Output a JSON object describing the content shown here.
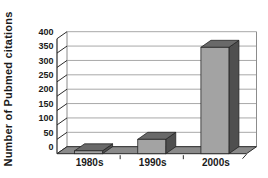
{
  "figure": {
    "y_axis_title": "Number of Pubmed citations"
  },
  "chart_data": {
    "type": "bar",
    "style": "3d-column",
    "title": "",
    "xlabel": "",
    "ylabel": "Number of Pubmed citations",
    "categories": [
      "1980s",
      "1990s",
      "2000s"
    ],
    "values": [
      10,
      50,
      370
    ],
    "ylim": [
      0,
      400
    ],
    "yticks": [
      0,
      50,
      100,
      150,
      200,
      250,
      300,
      350,
      400
    ],
    "grid": true,
    "legend": false
  },
  "colors": {
    "background": "#ffffff",
    "wall": "#ffffff",
    "gridline": "#a8a8a8",
    "wall_edge": "#8c8c8c",
    "axis": "#2b2b2b",
    "floor": "#8a8a8a",
    "bar_front": "#a3a3a3",
    "bar_top": "#696969",
    "bar_side": "#4f4f4f",
    "bar_outline": "#262626",
    "text": "#1a1a1a"
  }
}
